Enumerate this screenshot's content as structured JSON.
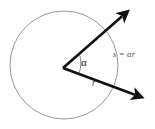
{
  "figure": {
    "background_color": "#ffffff",
    "width": 155,
    "height": 129
  },
  "circle": {
    "name": "circle-outline",
    "center_x": 64,
    "center_y": 65,
    "radius": 54,
    "stroke_color": "#8c8c8c",
    "stroke_width": 0.9,
    "fill": "none"
  },
  "vertex": {
    "x": 63,
    "y": 68
  },
  "rays": [
    {
      "name": "upper-ray",
      "label": "",
      "x1": 63,
      "y1": 68,
      "x2": 127,
      "y2": 12,
      "stroke_color": "#111111",
      "stroke_width": 2.6,
      "arrowhead": "end"
    },
    {
      "name": "lower-ray",
      "label": "r",
      "x1": 63,
      "y1": 68,
      "x2": 141,
      "y2": 97,
      "stroke_color": "#111111",
      "stroke_width": 2.6,
      "arrowhead": "end"
    }
  ],
  "angle_arc": {
    "name": "angle-indicator",
    "stroke_color": "#6b6b6b",
    "stroke_width": 0.8
  },
  "labels": {
    "angle": "α",
    "arc_length": "s = αr",
    "radius": "r"
  },
  "colors": {
    "line": "#111111",
    "circle": "#8c8c8c",
    "text": "#3a3a3a",
    "background": "#ffffff"
  }
}
